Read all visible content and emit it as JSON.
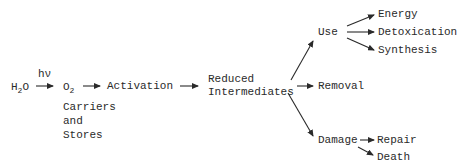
{
  "diagram": {
    "nodes": {
      "water": {
        "base": "H",
        "sub": "2",
        "tail": "O"
      },
      "light": "hν",
      "oxygen": {
        "base": "O",
        "sub": "2"
      },
      "carriers": [
        "Carriers",
        "and",
        "Stores"
      ],
      "activation": "Activation",
      "reduced": [
        "Reduced",
        "Intermediates"
      ],
      "use": "Use",
      "energy": "Energy",
      "detoxication": "Detoxication",
      "synthesis": "Synthesis",
      "removal": "Removal",
      "damage": "Damage",
      "repair": "Repair",
      "death": "Death"
    },
    "edges": [
      {
        "from": "water",
        "to": "oxygen",
        "label": "hν"
      },
      {
        "from": "oxygen",
        "to": "activation"
      },
      {
        "from": "activation",
        "to": "reduced"
      },
      {
        "from": "reduced",
        "to": "use"
      },
      {
        "from": "reduced",
        "to": "removal"
      },
      {
        "from": "reduced",
        "to": "damage"
      },
      {
        "from": "use",
        "to": "energy"
      },
      {
        "from": "use",
        "to": "detoxication"
      },
      {
        "from": "use",
        "to": "synthesis"
      },
      {
        "from": "damage",
        "to": "repair"
      },
      {
        "from": "damage",
        "to": "death"
      }
    ],
    "colors": {
      "ink": "#2a2a2a",
      "background": "#ffffff"
    }
  }
}
